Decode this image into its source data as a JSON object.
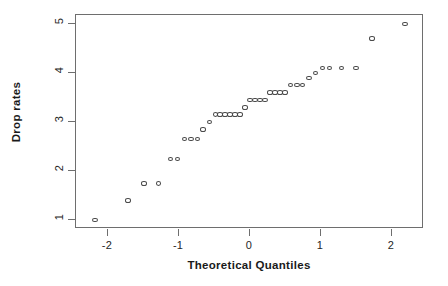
{
  "chart_data": {
    "type": "scatter",
    "title": "",
    "subtitle": "",
    "xlabel": "Theoretical Quantiles",
    "ylabel": "Drop rates",
    "xlim": [
      -2.45,
      2.45
    ],
    "ylim": [
      0.82,
      5.18
    ],
    "xticks": [
      -2,
      -1,
      0,
      1,
      2
    ],
    "xticklabels": [
      "-2",
      "-1",
      "0",
      "1",
      "2"
    ],
    "yticks": [
      1,
      2,
      3,
      4,
      5
    ],
    "yticklabels": [
      "1",
      "2",
      "3",
      "4",
      "5"
    ],
    "grid": false,
    "legend": null,
    "marker": "open-circle",
    "marker_color": "#4a4a4a",
    "series": [
      {
        "name": "Sample quantiles",
        "x": [
          -2.18,
          -1.72,
          -1.49,
          -1.29,
          -1.12,
          -1.02,
          -0.92,
          -0.83,
          -0.74,
          -0.66,
          -0.57,
          -0.49,
          -0.42,
          -0.35,
          -0.28,
          -0.21,
          -0.14,
          -0.07,
          0.0,
          0.07,
          0.14,
          0.21,
          0.28,
          0.35,
          0.42,
          0.49,
          0.57,
          0.66,
          0.74,
          0.83,
          0.92,
          1.02,
          1.12,
          1.29,
          1.49,
          1.72,
          2.18
        ],
        "y": [
          1.0,
          1.4,
          1.75,
          1.75,
          2.25,
          2.25,
          2.65,
          2.65,
          2.65,
          2.85,
          3.0,
          3.15,
          3.15,
          3.15,
          3.15,
          3.15,
          3.15,
          3.3,
          3.45,
          3.45,
          3.45,
          3.45,
          3.6,
          3.6,
          3.6,
          3.6,
          3.75,
          3.75,
          3.75,
          3.9,
          4.0,
          4.1,
          4.1,
          4.1,
          4.1,
          4.7,
          5.0
        ]
      }
    ]
  },
  "axes": {
    "x_title": "Theoretical Quantiles",
    "y_title": "Drop rates"
  }
}
